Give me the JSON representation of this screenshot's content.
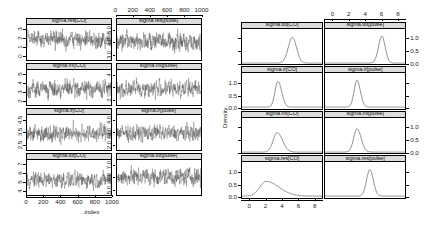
{
  "figure": {
    "title": "",
    "left_block_xlabel": ".index",
    "right_block_ylabel": "Density"
  },
  "chart_data": [
    {
      "type": "line",
      "title": "",
      "subtitle": "MCMC trace plots",
      "xlabel": ".index",
      "ylabel": "",
      "grid": false,
      "legend": "none",
      "layout": {
        "rows": 4,
        "cols": 2
      },
      "x_axis": {
        "ticks": [
          0,
          200,
          400,
          600,
          800,
          1000
        ],
        "range": [
          0,
          1000
        ],
        "position": "top-and-bottom"
      },
      "panels": [
        {
          "strip": "sigma.res[CO]",
          "row": 1,
          "col": 1,
          "y_ticks": [
            "0",
            "1",
            "2",
            "3"
          ],
          "ylim": [
            -0.2,
            3.4
          ],
          "mean": 1.9,
          "sd": 0.55
        },
        {
          "strip": "sigma.res[pulse]",
          "row": 1,
          "col": 2,
          "y_ticks": [
            "3.0",
            "4.0",
            "5.0"
          ],
          "ylim": [
            2.7,
            5.4
          ],
          "mean": 4.1,
          "sd": 0.42
        },
        {
          "strip": "sigma.mi[CO]",
          "row": 2,
          "col": 1,
          "y_ticks": [
            "2",
            "3",
            "4",
            "5"
          ],
          "ylim": [
            1.7,
            5.4
          ],
          "mean": 3.4,
          "sd": 0.55
        },
        {
          "strip": "sigma.mi[pulse]",
          "row": 2,
          "col": 2,
          "y_ticks": [
            "2",
            "3",
            "4"
          ],
          "ylim": [
            1.7,
            4.5
          ],
          "mean": 3.0,
          "sd": 0.42
        },
        {
          "strip": "sigma.ir[CO]",
          "row": 3,
          "col": 1,
          "y_ticks": [
            "2.5",
            "3.5",
            "4.5"
          ],
          "ylim": [
            2.2,
            4.9
          ],
          "mean": 3.5,
          "sd": 0.4
        },
        {
          "strip": "sigma.ir[pulse]",
          "row": 3,
          "col": 2,
          "y_ticks": [
            "2.0",
            "3.0",
            "4.0"
          ],
          "ylim": [
            1.7,
            4.4
          ],
          "mean": 3.0,
          "sd": 0.38
        },
        {
          "strip": "sigma.tot[CO]",
          "row": 4,
          "col": 1,
          "y_ticks": [
            "4",
            "5",
            "6",
            "7"
          ],
          "ylim": [
            3.7,
            7.4
          ],
          "mean": 5.3,
          "sd": 0.52
        },
        {
          "strip": "sigma.tot[pulse]",
          "row": 4,
          "col": 2,
          "y_ticks": [
            "5.0",
            "6.0",
            "7.0"
          ],
          "ylim": [
            4.7,
            7.4
          ],
          "mean": 6.1,
          "sd": 0.42
        }
      ]
    },
    {
      "type": "line",
      "title": "",
      "subtitle": "Posterior density plots",
      "xlabel": "",
      "ylabel": "Density",
      "grid": false,
      "legend": "none",
      "layout": {
        "rows": 4,
        "cols": 2
      },
      "x_axis": {
        "ticks": [
          0,
          2,
          4,
          6,
          8
        ],
        "range": [
          -1,
          9
        ],
        "position": "top-and-bottom"
      },
      "y_axis": {
        "ticks": [
          "0.0",
          "0.5",
          "1.0"
        ],
        "range": [
          0,
          1.25
        ]
      },
      "panels": [
        {
          "strip": "sigma.tot[CO]",
          "row": 1,
          "col": 1,
          "mode": 5.3,
          "sd": 0.52,
          "peak": 1.05,
          "y_side": "none",
          "skew": 0.0
        },
        {
          "strip": "sigma.tot[pulse]",
          "row": 1,
          "col": 2,
          "mode": 6.1,
          "sd": 0.42,
          "peak": 1.1,
          "y_side": "right",
          "skew": 0.0
        },
        {
          "strip": "sigma.ir[CO]",
          "row": 2,
          "col": 1,
          "mode": 3.5,
          "sd": 0.4,
          "peak": 1.05,
          "y_side": "left",
          "skew": 0.15
        },
        {
          "strip": "sigma.ir[pulse]",
          "row": 2,
          "col": 2,
          "mode": 3.0,
          "sd": 0.38,
          "peak": 1.1,
          "y_side": "none",
          "skew": 0.1
        },
        {
          "strip": "sigma.mi[CO]",
          "row": 3,
          "col": 1,
          "mode": 3.4,
          "sd": 0.55,
          "peak": 0.8,
          "y_side": "none",
          "skew": 0.2
        },
        {
          "strip": "sigma.mi[pulse]",
          "row": 3,
          "col": 2,
          "mode": 3.0,
          "sd": 0.45,
          "peak": 0.95,
          "y_side": "right",
          "skew": 0.15
        },
        {
          "strip": "sigma.res[CO]",
          "row": 4,
          "col": 1,
          "mode": 2.0,
          "sd": 1.05,
          "peak": 0.6,
          "y_side": "left",
          "skew": 0.55
        },
        {
          "strip": "sigma.res[pulse]",
          "row": 4,
          "col": 2,
          "mode": 4.6,
          "sd": 0.42,
          "peak": 1.08,
          "y_side": "none",
          "skew": 0.05
        }
      ]
    }
  ]
}
